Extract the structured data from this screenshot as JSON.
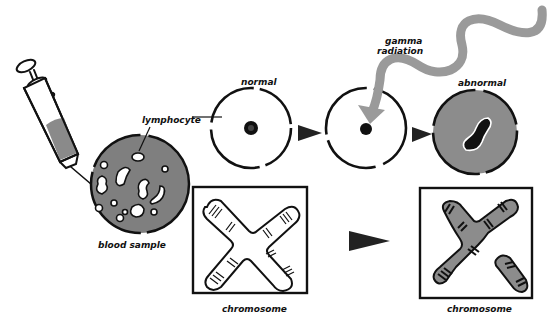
{
  "diagram": {
    "labels": {
      "lymphocyte": "lymphocyte",
      "blood_sample": "blood sample",
      "normal": "normal",
      "gamma": "gamma",
      "radiation": "radiation",
      "abnormal": "abnormal",
      "chromosome_normal": "chromosome",
      "chromosome_abnormal": "chromosome"
    },
    "colors": {
      "ink": "#111111",
      "gray_fill": "#8c8c8c",
      "radiation_gray": "#9a9a9a",
      "background": "#ffffff"
    }
  }
}
